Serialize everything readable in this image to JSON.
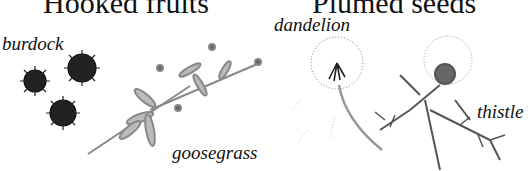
{
  "panels": [
    {
      "title": "Hooked fruits",
      "specimens": [
        {
          "label": "burdock"
        },
        {
          "label": "goosegrass"
        }
      ]
    },
    {
      "title": "Plumed seeds",
      "specimens": [
        {
          "label": "dandelion"
        },
        {
          "label": "thistle"
        }
      ]
    }
  ],
  "colors": {
    "ink": "#111111",
    "foliage": "#777777",
    "background": "#ffffff"
  }
}
